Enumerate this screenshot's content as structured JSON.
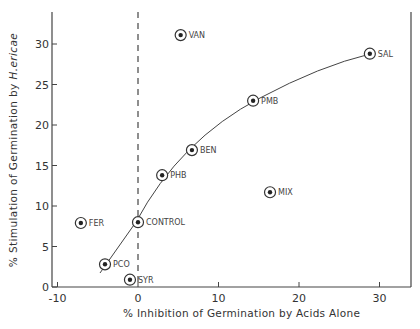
{
  "chart_data": {
    "type": "scatter",
    "title": "",
    "xlabel": "% Inhibition of Germination by Acids Alone",
    "ylabel_prefix": "% Stimulation of Germination by",
    "ylabel_species": "H.ericae",
    "xlim": [
      -11,
      34
    ],
    "ylim": [
      0,
      34
    ],
    "x_ticks": [
      -10,
      0,
      10,
      20,
      30
    ],
    "y_ticks": [
      0,
      5,
      10,
      15,
      20,
      25,
      30
    ],
    "grid": false,
    "legend": "none",
    "reference_line": {
      "type": "vertical-dashed",
      "x": 0
    },
    "fit_curve": {
      "type": "curve",
      "through": [
        "PCO",
        "CONTROL",
        "PHB",
        "BEN",
        "PMB",
        "SAL"
      ]
    },
    "points": [
      {
        "label": "VAN",
        "x": 5.3,
        "y": 31.1
      },
      {
        "label": "SAL",
        "x": 28.8,
        "y": 28.8
      },
      {
        "label": "PMB",
        "x": 14.3,
        "y": 23.0
      },
      {
        "label": "BEN",
        "x": 6.7,
        "y": 16.9
      },
      {
        "label": "PHB",
        "x": 3.0,
        "y": 13.8
      },
      {
        "label": "MIX",
        "x": 16.4,
        "y": 11.7
      },
      {
        "label": "FER",
        "x": -7.1,
        "y": 7.9
      },
      {
        "label": "CONTROL",
        "x": 0.0,
        "y": 8.0
      },
      {
        "label": "PCO",
        "x": -4.1,
        "y": 2.8
      },
      {
        "label": "SYR",
        "x": -1.0,
        "y": 0.9
      }
    ]
  },
  "colors": {
    "ink": "#333333",
    "background": "#ffffff"
  }
}
